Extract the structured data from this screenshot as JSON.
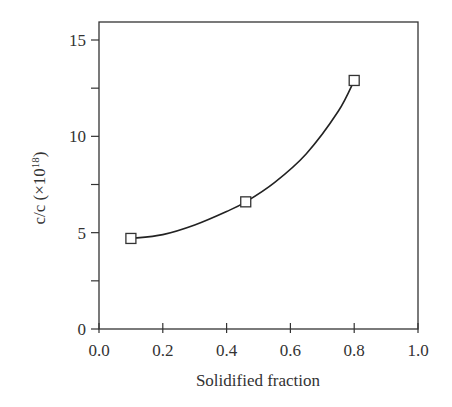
{
  "chart_data": {
    "type": "line",
    "title": "",
    "xlabel": "Solidified fraction",
    "ylabel": "c/c (×10",
    "ylabel_superscript": "18",
    "ylabel_suffix": ")",
    "xlim": [
      0.0,
      1.0
    ],
    "ylim": [
      0,
      16
    ],
    "x_ticks": [
      "0.0",
      "0.2",
      "0.4",
      "0.6",
      "0.8",
      "1.0"
    ],
    "y_ticks": [
      "0",
      "5",
      "10",
      "15"
    ],
    "grid": false,
    "legend": null,
    "series": [
      {
        "name": "measured",
        "marker": "open-square",
        "x": [
          0.1,
          0.46,
          0.8
        ],
        "y": [
          4.7,
          6.6,
          12.9
        ]
      },
      {
        "name": "fit",
        "style": "smooth-curve",
        "x": [
          0.1,
          0.2,
          0.3,
          0.4,
          0.46,
          0.55,
          0.65,
          0.75,
          0.8
        ],
        "y": [
          4.7,
          4.9,
          5.4,
          6.1,
          6.6,
          7.6,
          9.1,
          11.3,
          12.9
        ]
      }
    ]
  }
}
